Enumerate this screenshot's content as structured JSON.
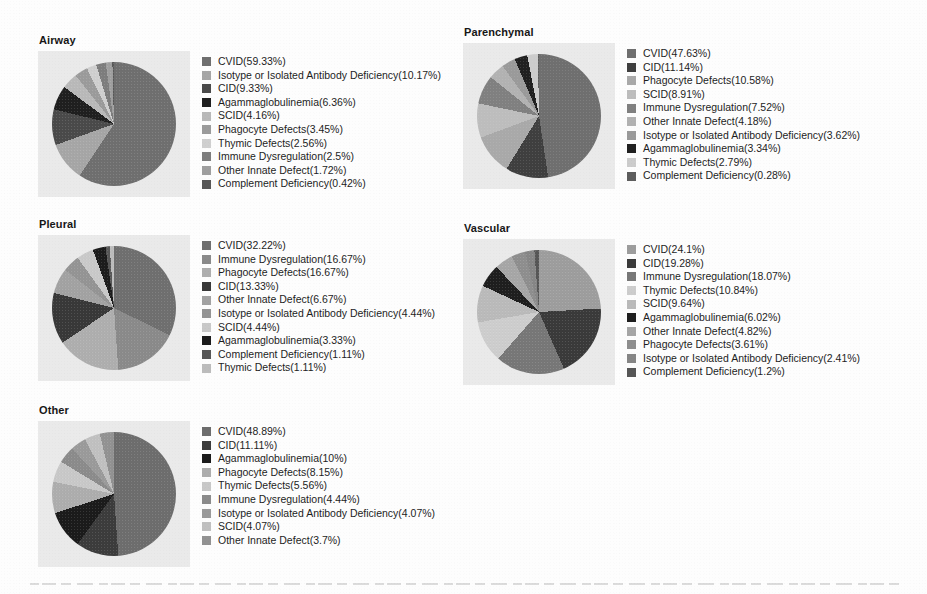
{
  "figure": {
    "background_color": "#fdfdfd",
    "plot_background_color": "#eaeaea"
  },
  "panels": [
    {
      "id": "airway",
      "title": "Airway",
      "rows": [
        {
          "label": "CVID(59.33%)",
          "color": "#6f6f6f"
        },
        {
          "label": "Isotype or Isolated Antibody Deficiency(10.17%)",
          "color": "#a6a6a6"
        },
        {
          "label": "CID(9.33%)",
          "color": "#4a4a4a"
        },
        {
          "label": "Agammaglobulinemia(6.36%)",
          "color": "#1f1f1f"
        },
        {
          "label": "SCID(4.16%)",
          "color": "#b9b9b9"
        },
        {
          "label": "Phagocyte Defects(3.45%)",
          "color": "#9b9b9b"
        },
        {
          "label": "Thymic Defects(2.56%)",
          "color": "#cfcfcf"
        },
        {
          "label": "Immune Dysregulation(2.5%)",
          "color": "#7d7d7d"
        },
        {
          "label": "Other Innate Defect(1.72%)",
          "color": "#9f9f9f"
        },
        {
          "label": "Complement Deficiency(0.42%)",
          "color": "#585858"
        }
      ]
    },
    {
      "id": "parenchymal",
      "title": "Parenchymal",
      "rows": [
        {
          "label": "CVID(47.63%)",
          "color": "#6f6f6f"
        },
        {
          "label": "CID(11.14%)",
          "color": "#3f3f3f"
        },
        {
          "label": "Phagocyte Defects(10.58%)",
          "color": "#a9a9a9"
        },
        {
          "label": "SCID(8.91%)",
          "color": "#bdbdbd"
        },
        {
          "label": "Immune Dysregulation(7.52%)",
          "color": "#808080"
        },
        {
          "label": "Other Innate Defect(4.18%)",
          "color": "#b2b2b2"
        },
        {
          "label": "Isotype or Isolated Antibody Deficiency(3.62%)",
          "color": "#9a9a9a"
        },
        {
          "label": "Agammaglobulinemia(3.34%)",
          "color": "#202020"
        },
        {
          "label": "Thymic Defects(2.79%)",
          "color": "#cccccc"
        },
        {
          "label": "Complement Deficiency(0.28%)",
          "color": "#5d5d5d"
        }
      ]
    },
    {
      "id": "pleural",
      "title": "Pleural",
      "rows": [
        {
          "label": "CVID(32.22%)",
          "color": "#6f6f6f"
        },
        {
          "label": "Immune Dysregulation(16.67%)",
          "color": "#8a8a8a"
        },
        {
          "label": "Phagocyte Defects(16.67%)",
          "color": "#aeaeae"
        },
        {
          "label": "CID(13.33%)",
          "color": "#383838"
        },
        {
          "label": "Other Innate Defect(6.67%)",
          "color": "#a2a2a2"
        },
        {
          "label": "Isotype or Isolated Antibody Deficiency(4.44%)",
          "color": "#949494"
        },
        {
          "label": "SCID(4.44%)",
          "color": "#c9c9c9"
        },
        {
          "label": "Agammaglobulinemia(3.33%)",
          "color": "#1c1c1c"
        },
        {
          "label": "Complement Deficiency(1.11%)",
          "color": "#575757"
        },
        {
          "label": "Thymic Defects(1.11%)",
          "color": "#bcbcbc"
        }
      ]
    },
    {
      "id": "vascular",
      "title": "Vascular",
      "rows": [
        {
          "label": "CVID(24.1%)",
          "color": "#9d9d9d"
        },
        {
          "label": "CID(19.28%)",
          "color": "#3a3a3a"
        },
        {
          "label": "Immune Dysregulation(18.07%)",
          "color": "#777777"
        },
        {
          "label": "Thymic Defects(10.84%)",
          "color": "#cdcdcd"
        },
        {
          "label": "SCID(9.64%)",
          "color": "#bababa"
        },
        {
          "label": "Agammaglobulinemia(6.02%)",
          "color": "#1e1e1e"
        },
        {
          "label": "Other Innate Defect(4.82%)",
          "color": "#a6a6a6"
        },
        {
          "label": "Phagocyte Defects(3.61%)",
          "color": "#8e8e8e"
        },
        {
          "label": "Isotype or Isolated Antibody Deficiency(2.41%)",
          "color": "#868686"
        },
        {
          "label": "Complement Deficiency(1.2%)",
          "color": "#565656"
        }
      ]
    },
    {
      "id": "other",
      "title": "Other",
      "rows": [
        {
          "label": "CVID(48.89%)",
          "color": "#6d6d6d"
        },
        {
          "label": "CID(11.11%)",
          "color": "#3c3c3c"
        },
        {
          "label": "Agammaglobulinemia(10%)",
          "color": "#1b1b1b"
        },
        {
          "label": "Phagocyte Defects(8.15%)",
          "color": "#adadad"
        },
        {
          "label": "Thymic Defects(5.56%)",
          "color": "#c8c8c8"
        },
        {
          "label": "Immune Dysregulation(4.44%)",
          "color": "#8b8b8b"
        },
        {
          "label": "Isotype or Isolated Antibody Deficiency(4.07%)",
          "color": "#9a9a9a"
        },
        {
          "label": "SCID(4.07%)",
          "color": "#c0c0c0"
        },
        {
          "label": "Other Innate Defect(3.7%)",
          "color": "#929292"
        }
      ]
    }
  ],
  "chart_data": [
    {
      "type": "pie",
      "title": "Airway",
      "start_angle_deg": 0,
      "direction": "clockwise",
      "units": "percent",
      "labels": [
        "CVID",
        "Isotype or Isolated Antibody Deficiency",
        "CID",
        "Agammaglobulinemia",
        "SCID",
        "Phagocyte Defects",
        "Thymic Defects",
        "Immune Dysregulation",
        "Other Innate Defect",
        "Complement Deficiency"
      ],
      "values": [
        59.33,
        10.17,
        9.33,
        6.36,
        4.16,
        3.45,
        2.56,
        2.5,
        1.72,
        0.42
      ],
      "colors": [
        "#6f6f6f",
        "#a6a6a6",
        "#4a4a4a",
        "#1f1f1f",
        "#b9b9b9",
        "#9b9b9b",
        "#cfcfcf",
        "#7d7d7d",
        "#9f9f9f",
        "#585858"
      ],
      "legend_position": "right"
    },
    {
      "type": "pie",
      "title": "Parenchymal",
      "start_angle_deg": 0,
      "direction": "clockwise",
      "units": "percent",
      "labels": [
        "CVID",
        "CID",
        "Phagocyte Defects",
        "SCID",
        "Immune Dysregulation",
        "Other Innate Defect",
        "Isotype or Isolated Antibody Deficiency",
        "Agammaglobulinemia",
        "Thymic Defects",
        "Complement Deficiency"
      ],
      "values": [
        47.63,
        11.14,
        10.58,
        8.91,
        7.52,
        4.18,
        3.62,
        3.34,
        2.79,
        0.28
      ],
      "colors": [
        "#6f6f6f",
        "#3f3f3f",
        "#a9a9a9",
        "#bdbdbd",
        "#808080",
        "#b2b2b2",
        "#9a9a9a",
        "#202020",
        "#cccccc",
        "#5d5d5d"
      ],
      "legend_position": "right"
    },
    {
      "type": "pie",
      "title": "Pleural",
      "start_angle_deg": 0,
      "direction": "clockwise",
      "units": "percent",
      "labels": [
        "CVID",
        "Immune Dysregulation",
        "Phagocyte Defects",
        "CID",
        "Other Innate Defect",
        "Isotype or Isolated Antibody Deficiency",
        "SCID",
        "Agammaglobulinemia",
        "Complement Deficiency",
        "Thymic Defects"
      ],
      "values": [
        32.22,
        16.67,
        16.67,
        13.33,
        6.67,
        4.44,
        4.44,
        3.33,
        1.11,
        1.11
      ],
      "colors": [
        "#6f6f6f",
        "#8a8a8a",
        "#aeaeae",
        "#383838",
        "#a2a2a2",
        "#949494",
        "#c9c9c9",
        "#1c1c1c",
        "#575757",
        "#bcbcbc"
      ],
      "legend_position": "right"
    },
    {
      "type": "pie",
      "title": "Vascular",
      "start_angle_deg": 0,
      "direction": "clockwise",
      "units": "percent",
      "labels": [
        "CVID",
        "CID",
        "Immune Dysregulation",
        "Thymic Defects",
        "SCID",
        "Agammaglobulinemia",
        "Other Innate Defect",
        "Phagocyte Defects",
        "Isotype or Isolated Antibody Deficiency",
        "Complement Deficiency"
      ],
      "values": [
        24.1,
        19.28,
        18.07,
        10.84,
        9.64,
        6.02,
        4.82,
        3.61,
        2.41,
        1.2
      ],
      "colors": [
        "#9d9d9d",
        "#3a3a3a",
        "#777777",
        "#cdcdcd",
        "#bababa",
        "#1e1e1e",
        "#a6a6a6",
        "#8e8e8e",
        "#868686",
        "#565656"
      ],
      "legend_position": "right"
    },
    {
      "type": "pie",
      "title": "Other",
      "start_angle_deg": 0,
      "direction": "clockwise",
      "units": "percent",
      "labels": [
        "CVID",
        "CID",
        "Agammaglobulinemia",
        "Phagocyte Defects",
        "Thymic Defects",
        "Immune Dysregulation",
        "Isotype or Isolated Antibody Deficiency",
        "SCID",
        "Other Innate Defect"
      ],
      "values": [
        48.89,
        11.11,
        10,
        8.15,
        5.56,
        4.44,
        4.07,
        4.07,
        3.7
      ],
      "colors": [
        "#6d6d6d",
        "#3c3c3c",
        "#1b1b1b",
        "#adadad",
        "#c8c8c8",
        "#8b8b8b",
        "#9a9a9a",
        "#c0c0c0",
        "#929292"
      ],
      "legend_position": "right"
    }
  ]
}
